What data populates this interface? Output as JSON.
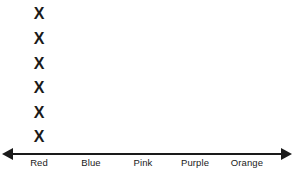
{
  "chart_data": {
    "type": "bar",
    "subtype": "dot-plot",
    "title": "",
    "subtitle": "",
    "xlabel": "",
    "ylabel": "",
    "categories": [
      "Red",
      "Blue",
      "Pink",
      "Purple",
      "Orange"
    ],
    "values": [
      6,
      0,
      0,
      0,
      0
    ],
    "mark_symbol": "X",
    "ylim": [
      0,
      6
    ],
    "grid": false,
    "legend": null,
    "axis": {
      "style": "double-arrow-number-line",
      "left_arrow": true,
      "right_arrow": true
    },
    "annotations": []
  },
  "colors": {
    "ink": "#1a1a1a",
    "background": "#ffffff"
  }
}
